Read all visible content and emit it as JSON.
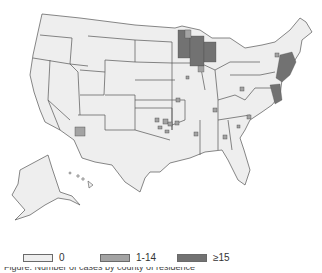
{
  "map": {
    "region": "United States (counties)",
    "state_fill": "#eeeeee",
    "state_stroke": "#555555",
    "insets": [
      "Alaska",
      "Hawaii"
    ]
  },
  "legend": {
    "items": [
      {
        "label": "0",
        "color": "#eeeeee"
      },
      {
        "label": "1-14",
        "color": "#a3a3a3"
      },
      {
        "label": "≥15",
        "color": "#727272"
      }
    ]
  },
  "highlighted_regions": {
    "dark_ge15": [
      "Minnesota",
      "Wisconsin",
      "Northeast coast (NY/NJ/CT/MA)",
      "Maryland/Virginia coast"
    ],
    "medium_1_14": [
      "Arizona (1 county)",
      "Oklahoma (scattered)",
      "Scattered counties across Midwest and Southeast"
    ]
  },
  "caption": {
    "text": "Figure. Number of cases by county of residence"
  }
}
